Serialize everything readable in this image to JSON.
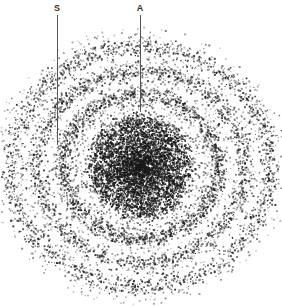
{
  "diagram": {
    "type": "electron-density-dot-plot",
    "background": "#ffffff",
    "dot_color": "#1a1a1a",
    "center": {
      "x": 140,
      "y": 166
    },
    "aspect_x": 1.08,
    "core": {
      "radius": 50,
      "count": 5200
    },
    "rings": [
      {
        "radius": 72,
        "width": 7,
        "count": 1500
      },
      {
        "radius": 96,
        "width": 8,
        "count": 1700
      },
      {
        "radius": 120,
        "width": 9,
        "count": 1800
      }
    ],
    "labels": [
      {
        "text": "S",
        "x": 57,
        "label_y": 4,
        "line_top": 15,
        "line_bottom": 145
      },
      {
        "text": "A",
        "x": 140,
        "label_y": 4,
        "line_top": 15,
        "line_bottom": 112
      }
    ]
  }
}
